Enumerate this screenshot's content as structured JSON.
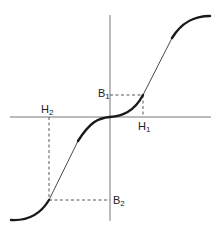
{
  "diagram": {
    "type": "magnetization curve (B vs H)",
    "axes": {
      "horizontal": "H",
      "vertical": "B"
    },
    "labels": {
      "B1": {
        "base": "B",
        "sub": "1"
      },
      "H1": {
        "base": "H",
        "sub": "1"
      },
      "B2": {
        "base": "B",
        "sub": "2"
      },
      "H2": {
        "base": "H",
        "sub": "2"
      }
    },
    "points": [
      {
        "name": "point-1",
        "H": "H1",
        "B": "B1"
      },
      {
        "name": "point-2",
        "H": "H2",
        "B": "B2"
      }
    ],
    "colors": {
      "axis": "#777777",
      "curve": "#1a1a1a",
      "dashed": "#444444",
      "text": "#222222"
    }
  }
}
